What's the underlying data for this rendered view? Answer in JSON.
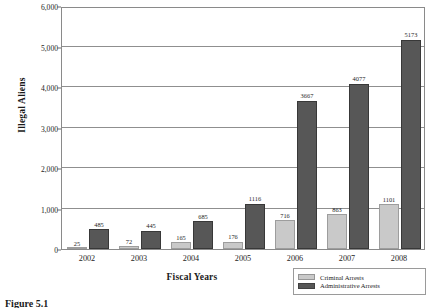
{
  "chart_data": {
    "type": "bar",
    "title": "",
    "xlabel": "Fiscal Years",
    "ylabel": "Illegal Aliens",
    "categories": [
      "2002",
      "2003",
      "2004",
      "2005",
      "2006",
      "2007",
      "2008"
    ],
    "series": [
      {
        "name": "Criminal Arrests",
        "color": "#c9c9c9",
        "values": [
          25,
          72,
          165,
          176,
          716,
          863,
          1101
        ]
      },
      {
        "name": "Administrative Arrests",
        "color": "#575757",
        "values": [
          485,
          445,
          685,
          1116,
          3667,
          4077,
          5173
        ]
      }
    ],
    "ylim": [
      0,
      6000
    ],
    "yticks": [
      0,
      1000,
      2000,
      3000,
      4000,
      5000,
      6000
    ],
    "ytick_labels": [
      "0",
      "1,000",
      "2,000",
      "3,000",
      "4,000",
      "5,000",
      "6,000"
    ],
    "grid": "horizontal",
    "legend_position": "bottom-right",
    "data_labels": true
  },
  "legend": {
    "items": [
      {
        "label": "Criminal Arrests",
        "color": "#c9c9c9"
      },
      {
        "label": "Administrative Arrests",
        "color": "#575757"
      }
    ]
  },
  "caption": {
    "text": "Figure  5.1"
  }
}
